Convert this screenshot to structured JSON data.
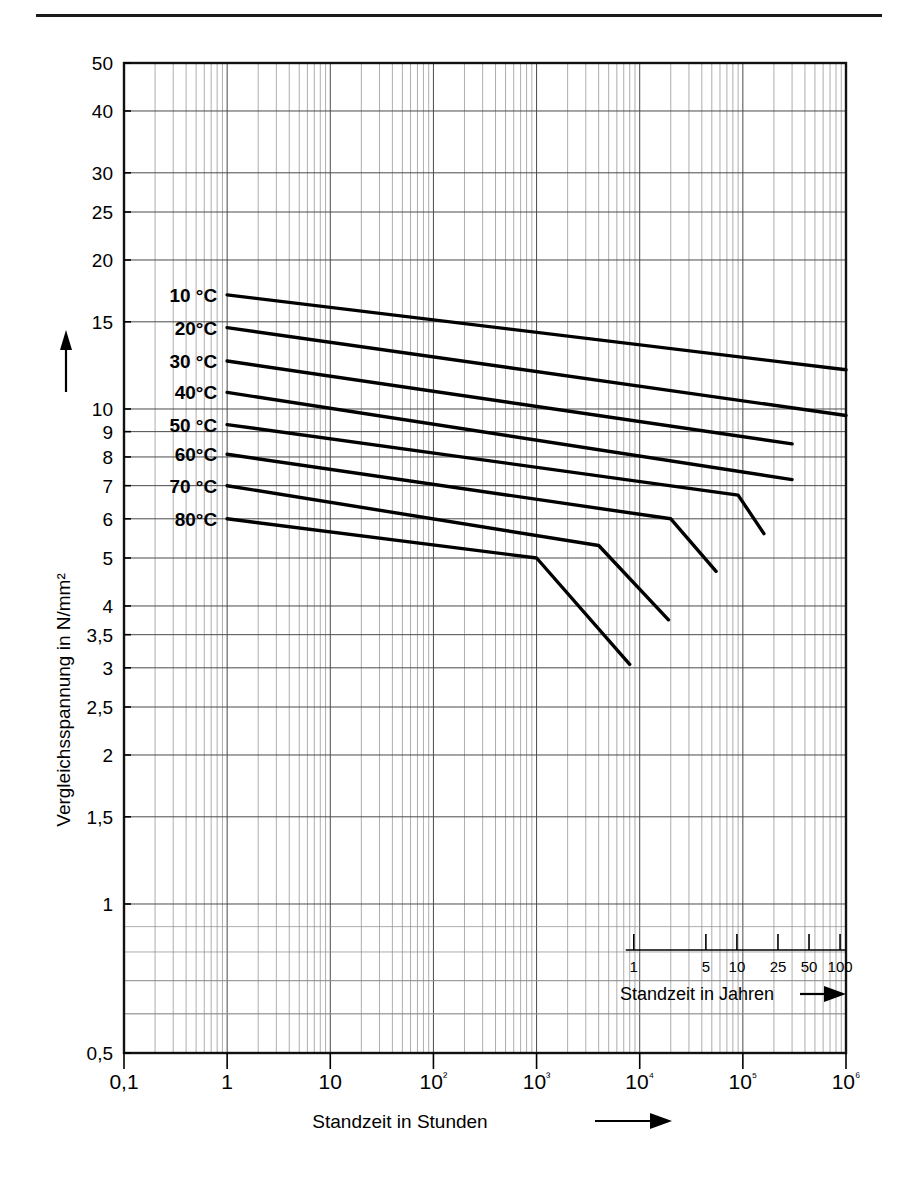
{
  "chart_data": {
    "type": "line",
    "title": "",
    "xlabel": "Standzeit in Stunden",
    "ylabel": "Vergleichsspannung in N/mm²",
    "xscale": "log",
    "yscale": "log",
    "xlim": [
      0.1,
      1000000
    ],
    "ylim": [
      0.5,
      50
    ],
    "grid": true,
    "legend": "inline-labels-left",
    "x_tick_labels": [
      "0,1",
      "1",
      "10",
      "10²",
      "10³",
      "10⁴",
      "10⁵",
      "10⁶"
    ],
    "x_tick_values": [
      0.1,
      1,
      10,
      100,
      1000,
      10000,
      100000,
      1000000
    ],
    "y_tick_labels": [
      "50",
      "40",
      "30",
      "25",
      "20",
      "15",
      "10",
      "9",
      "8",
      "7",
      "6",
      "5",
      "4",
      "3,5",
      "3",
      "2,5",
      "2",
      "1,5",
      "1",
      "0,5"
    ],
    "y_tick_values": [
      50,
      40,
      30,
      25,
      20,
      15,
      10,
      9,
      8,
      7,
      6,
      5,
      4,
      3.5,
      3,
      2.5,
      2,
      1.5,
      1,
      0.5
    ],
    "secondary_axis": {
      "label": "Standzeit in Jahren",
      "tick_labels": [
        "1",
        "5",
        "10",
        "25",
        "50",
        "100"
      ],
      "tick_values": [
        1,
        5,
        10,
        25,
        50,
        100
      ]
    },
    "series": [
      {
        "name": "10 °C",
        "label": "10 °C",
        "points": [
          [
            1,
            17.0
          ],
          [
            1000000,
            12.0
          ]
        ]
      },
      {
        "name": "20°C",
        "label": "20°C",
        "points": [
          [
            1,
            14.6
          ],
          [
            1000000,
            9.7
          ]
        ]
      },
      {
        "name": "30 °C",
        "label": "30 °C",
        "points": [
          [
            1,
            12.5
          ],
          [
            300000,
            8.5
          ]
        ]
      },
      {
        "name": "40°C",
        "label": "40°C",
        "points": [
          [
            1,
            10.8
          ],
          [
            300000,
            7.2
          ]
        ]
      },
      {
        "name": "50 °C",
        "label": "50 °C",
        "points": [
          [
            1,
            9.3
          ],
          [
            90000,
            6.7
          ],
          [
            160000,
            5.6
          ]
        ]
      },
      {
        "name": "60°C",
        "label": "60°C",
        "points": [
          [
            1,
            8.1
          ],
          [
            20000,
            6.0
          ],
          [
            55000,
            4.7
          ]
        ]
      },
      {
        "name": "70 °C",
        "label": "70 °C",
        "points": [
          [
            1,
            7.0
          ],
          [
            4000,
            5.3
          ],
          [
            19000,
            3.75
          ]
        ]
      },
      {
        "name": "80°C",
        "label": "80°C",
        "points": [
          [
            1,
            6.0
          ],
          [
            1000,
            5.0
          ],
          [
            8000,
            3.05
          ]
        ]
      }
    ]
  },
  "axis": {
    "y_arrow": "up-arrow",
    "x_arrow": "right-arrow"
  }
}
